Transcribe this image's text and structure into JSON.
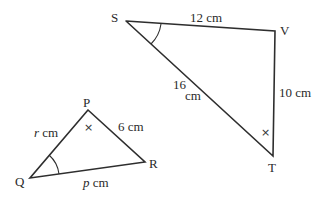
{
  "diagram": {
    "large_triangle": {
      "vertices": {
        "S": "S",
        "V": "V",
        "T": "T"
      },
      "sides": {
        "SV": "12 cm",
        "VT": "10 cm",
        "ST_num": "16",
        "ST_unit": "cm"
      },
      "angle_marks": {
        "S": "arc",
        "T": "×"
      }
    },
    "small_triangle": {
      "vertices": {
        "P": "P",
        "Q": "Q",
        "R": "R"
      },
      "sides": {
        "PQ_var": "r",
        "PQ_unit": " cm",
        "PR": "6 cm",
        "QR_var": "p",
        "QR_unit": " cm"
      },
      "angle_marks": {
        "Q": "arc",
        "P": "×"
      }
    },
    "colors": {
      "line": "#2e2e2e",
      "text": "#2a2a2a",
      "background": "#ffffff"
    }
  }
}
